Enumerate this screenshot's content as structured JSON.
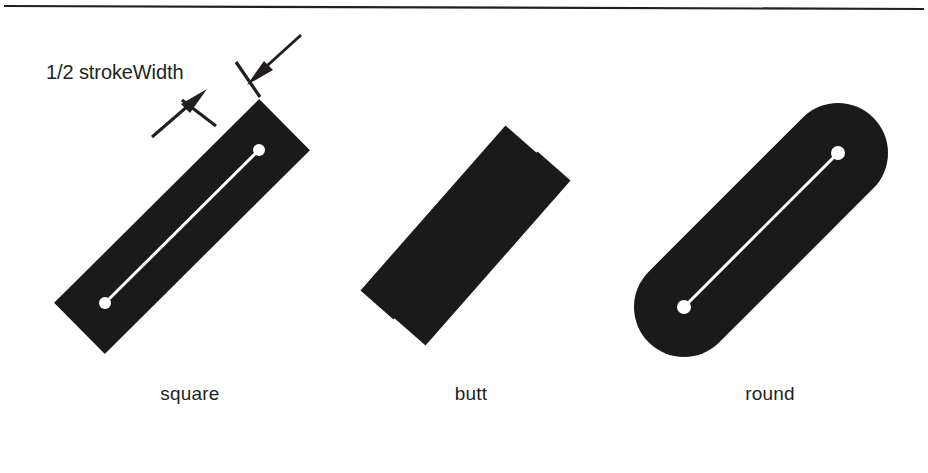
{
  "figure": {
    "background_color": "#ffffff",
    "ink_color": "#231f20",
    "highlight_color": "#ffffff",
    "rule": {
      "name": "top-rule",
      "x1": 4,
      "y1": 6,
      "x2": 924,
      "y2": 9,
      "thickness": 2,
      "color": "#231f20"
    },
    "annotation": {
      "label": "1/2 strokeWidth",
      "label_x": 46,
      "label_y": 61,
      "leader_upper": {
        "from_x": 300,
        "from_y": 36,
        "to_x": 252,
        "to_y": 78
      },
      "leader_lower": {
        "from_x": 156,
        "from_y": 133,
        "to_x": 198,
        "to_y": 97
      },
      "tick_upper": {
        "x1": 236,
        "y1": 62,
        "x2": 258,
        "y2": 95
      },
      "tick_lower": {
        "x1": 184,
        "y1": 101,
        "x2": 214,
        "y2": 124
      }
    },
    "caps": [
      {
        "id": "square",
        "label": "square",
        "label_center_x": 190,
        "label_baseline_y": 399,
        "shape": "rectangle",
        "description": "Stroke extended by half the stroke width beyond each endpoint, squared off.",
        "start_point": {
          "x": 105,
          "y": 303
        },
        "end_point": {
          "x": 259,
          "y": 150
        },
        "stroke_width": 72,
        "extension": 36,
        "angle_degrees": -45,
        "show_centerline": true,
        "show_endpoint_dots": true,
        "endpoint_dot_radius": 6
      },
      {
        "id": "butt",
        "label": "butt",
        "label_center_x": 471,
        "label_baseline_y": 399,
        "shape": "two-bars",
        "description": "Stroke terminates exactly at each endpoint with no extension.",
        "bar_a": {
          "start_x": 377,
          "start_y": 305,
          "end_x": 522,
          "end_y": 140
        },
        "bar_b": {
          "start_x": 409,
          "start_y": 331,
          "end_x": 554,
          "end_y": 166
        },
        "stroke_width": 44,
        "angle_degrees": -48,
        "show_centerline": false,
        "show_endpoint_dots": false
      },
      {
        "id": "round",
        "label": "round",
        "label_center_x": 770,
        "label_baseline_y": 399,
        "shape": "stadium",
        "description": "Stroke capped with a semicircle of radius half the stroke width at each endpoint.",
        "start_point": {
          "x": 684,
          "y": 307
        },
        "end_point": {
          "x": 838,
          "y": 153
        },
        "stroke_width": 100,
        "cap_radius": 50,
        "angle_degrees": -45,
        "show_centerline": true,
        "show_endpoint_dots": true,
        "endpoint_dot_radius": 7
      }
    ]
  }
}
